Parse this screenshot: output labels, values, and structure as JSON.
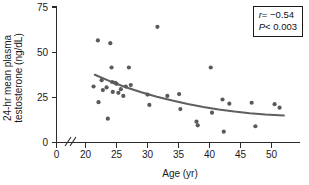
{
  "chart_data": {
    "type": "scatter",
    "title": "",
    "xlabel": "Age (yr)",
    "ylabel": "24-hr mean plasma testosterone (ng/dL)",
    "xlim": [
      18,
      53
    ],
    "ylim": [
      0,
      75
    ],
    "xticks": [
      0,
      20,
      25,
      30,
      35,
      40,
      45,
      50
    ],
    "xtick_labels": [
      "0",
      "20",
      "25",
      "30",
      "35",
      "40",
      "45",
      "50"
    ],
    "yticks": [
      0,
      25,
      50,
      75
    ],
    "ytick_labels": [
      "0",
      "25",
      "50",
      "75"
    ],
    "axis_break": true,
    "grid": false,
    "legend": "none",
    "marker_color": "#5a5a5a",
    "curve_color": "#5f5f5f",
    "points": [
      {
        "x": 21.3,
        "y": 31.0
      },
      {
        "x": 22.0,
        "y": 56.5
      },
      {
        "x": 22.1,
        "y": 22.3
      },
      {
        "x": 22.6,
        "y": 34.5
      },
      {
        "x": 22.8,
        "y": 29.0
      },
      {
        "x": 23.4,
        "y": 30.5
      },
      {
        "x": 23.6,
        "y": 13.2
      },
      {
        "x": 24.0,
        "y": 55.0
      },
      {
        "x": 24.2,
        "y": 41.5
      },
      {
        "x": 24.3,
        "y": 33.5
      },
      {
        "x": 24.4,
        "y": 28.0
      },
      {
        "x": 24.8,
        "y": 33.0
      },
      {
        "x": 25.0,
        "y": 32.5
      },
      {
        "x": 25.3,
        "y": 27.5
      },
      {
        "x": 25.7,
        "y": 29.5
      },
      {
        "x": 26.1,
        "y": 25.8
      },
      {
        "x": 26.5,
        "y": 31.0
      },
      {
        "x": 27.0,
        "y": 41.5
      },
      {
        "x": 27.3,
        "y": 31.8
      },
      {
        "x": 30.0,
        "y": 26.5
      },
      {
        "x": 30.3,
        "y": 20.8
      },
      {
        "x": 31.6,
        "y": 64.0
      },
      {
        "x": 33.2,
        "y": 25.8
      },
      {
        "x": 35.1,
        "y": 26.8
      },
      {
        "x": 35.3,
        "y": 18.5
      },
      {
        "x": 37.9,
        "y": 11.5
      },
      {
        "x": 38.1,
        "y": 9.5
      },
      {
        "x": 40.2,
        "y": 41.5
      },
      {
        "x": 40.4,
        "y": 16.5
      },
      {
        "x": 42.1,
        "y": 23.8
      },
      {
        "x": 42.3,
        "y": 6.0
      },
      {
        "x": 43.2,
        "y": 21.5
      },
      {
        "x": 46.8,
        "y": 22.0
      },
      {
        "x": 47.4,
        "y": 9.0
      },
      {
        "x": 50.5,
        "y": 21.2
      },
      {
        "x": 51.3,
        "y": 19.3
      }
    ],
    "fit_curve": {
      "description": "decaying regression curve",
      "x_start": 21.5,
      "x_end": 52.0,
      "y_start": 37.5,
      "y_end": 15.0,
      "points": [
        {
          "x": 21.5,
          "y": 37.5
        },
        {
          "x": 24.0,
          "y": 33.8
        },
        {
          "x": 26.5,
          "y": 30.6
        },
        {
          "x": 29.0,
          "y": 27.8
        },
        {
          "x": 31.5,
          "y": 25.3
        },
        {
          "x": 34.0,
          "y": 23.2
        },
        {
          "x": 36.5,
          "y": 21.3
        },
        {
          "x": 39.0,
          "y": 19.7
        },
        {
          "x": 41.5,
          "y": 18.3
        },
        {
          "x": 44.0,
          "y": 17.1
        },
        {
          "x": 46.5,
          "y": 16.2
        },
        {
          "x": 49.0,
          "y": 15.5
        },
        {
          "x": 52.0,
          "y": 15.0
        }
      ]
    },
    "annotations": {
      "correlation_label": "r",
      "correlation_value": "= −0.54",
      "pvalue_label": "P",
      "pvalue_value": "< 0.003"
    }
  }
}
